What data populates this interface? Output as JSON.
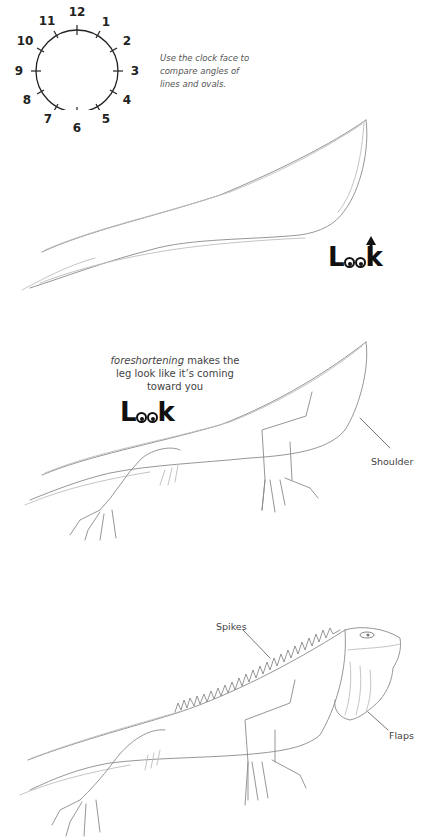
{
  "clock": {
    "numbers": [
      "12",
      "1",
      "2",
      "3",
      "4",
      "5",
      "6",
      "7",
      "8",
      "9",
      "10",
      "11"
    ],
    "caption": "Use the clock face to compare angles of lines and ovals."
  },
  "step1": {
    "look_badge": {
      "text_l": "L",
      "text_k": "k",
      "variant": "arrow"
    }
  },
  "step2": {
    "note_italic": "foreshortening",
    "note_rest_line1": " makes the",
    "note_line2": "leg look like it’s coming",
    "note_line3": "toward you",
    "look_badge": {
      "text_l": "L",
      "text_k": "k",
      "variant": "eyes-down"
    },
    "label_shoulder": "Shoulder"
  },
  "step3": {
    "label_spikes": "Spikes",
    "label_flaps": "Flaps"
  },
  "colors": {
    "ink": "#111111",
    "sketch": "#8a8a8a",
    "text": "#444444"
  }
}
